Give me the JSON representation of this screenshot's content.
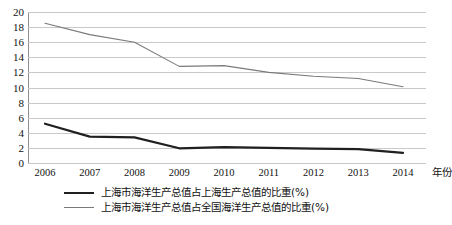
{
  "chart_data": {
    "type": "line",
    "title": "",
    "subtitle": "",
    "xlabel": "年份",
    "ylabel": "",
    "categories": [
      "2006",
      "2007",
      "2008",
      "2009",
      "2010",
      "2011",
      "2012",
      "2013",
      "2014"
    ],
    "ylim": [
      0,
      20
    ],
    "ytick_step": 2,
    "yticks": [
      "20",
      "18",
      "16",
      "14",
      "12",
      "10",
      "8",
      "6",
      "4",
      "2",
      "0"
    ],
    "grid": true,
    "legend_position": "bottom",
    "series": [
      {
        "name": "上海市海洋生产总值占上海生产总值的比重(%)",
        "color": "#202020",
        "width": 2.2,
        "values": [
          5.2,
          3.5,
          3.4,
          1.95,
          2.1,
          2.0,
          1.9,
          1.85,
          1.35
        ]
      },
      {
        "name": "上海市海洋生产总值占全国海洋生产总值的比重(%)",
        "color": "#7a7a7a",
        "width": 1.1,
        "values": [
          18.5,
          17.0,
          16.0,
          12.8,
          12.9,
          12.0,
          11.5,
          11.2,
          10.1
        ]
      }
    ]
  }
}
